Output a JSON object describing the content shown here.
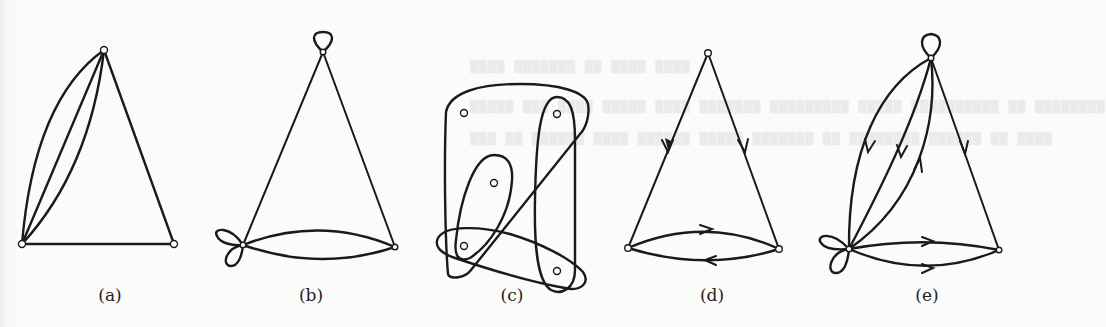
{
  "figure": {
    "panels": [
      {
        "id": "a",
        "label": "(a)",
        "description": "Undirected multigraph: 3 vertices, 3 parallel edges between top and bottom-left, edges top–bottom-right and bottom-left–bottom-right"
      },
      {
        "id": "b",
        "label": "(b)",
        "description": "Undirected multigraph with loops: loop at top vertex, two loops at bottom-left vertex, two parallel edges between bottom vertices"
      },
      {
        "id": "c",
        "label": "(c)",
        "description": "Hypergraph: 5 vertices enclosed by overlapping closed curves (hyperedges)"
      },
      {
        "id": "d",
        "label": "(d)",
        "description": "Directed graph: arcs from top to both bottom vertices, opposite arcs between bottom vertices"
      },
      {
        "id": "e",
        "label": "(e)",
        "description": "Directed multigraph with loops: loop at top, two loops at bottom-left, multiple arcs"
      }
    ]
  },
  "colors": {
    "ink": "#1a1a1a",
    "paper": "#fbfbfa"
  }
}
